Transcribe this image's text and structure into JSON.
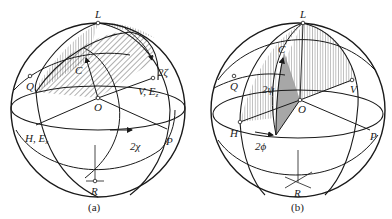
{
  "figure": {
    "panels": [
      {
        "id": "a",
        "caption": "(a)",
        "labels": {
          "L": "L",
          "C": "C",
          "Q": "Q",
          "O": "O",
          "V": "V, E",
          "V_sub": "z",
          "H": "H, E",
          "H_sub": "x",
          "P": "P",
          "R": "R",
          "angle_zeta": "2ζ",
          "angle_chi": "2χ"
        }
      },
      {
        "id": "b",
        "caption": "(b)",
        "labels": {
          "L": "L",
          "C": "C",
          "Q": "Q",
          "O": "O",
          "V": "V",
          "H": "H",
          "P": "P",
          "R": "R",
          "angle_psi": "2ψ",
          "angle_phi": "2ϕ"
        }
      }
    ]
  },
  "colors": {
    "line": "#1a1a1a",
    "background": "#ffffff",
    "shade_dark": "#8a8a8a"
  }
}
